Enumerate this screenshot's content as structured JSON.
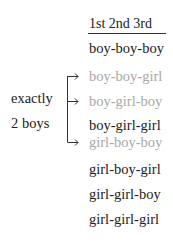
{
  "header": {
    "label": "1st  2nd 3rd"
  },
  "label": {
    "line1": "exactly",
    "line2": "2 boys"
  },
  "outcomes": [
    {
      "text": "boy-boy-boy",
      "highlighted": false
    },
    {
      "text": "boy-boy-girl",
      "highlighted": true
    },
    {
      "text": "boy-girl-boy",
      "highlighted": true
    },
    {
      "text": "boy-girl-girl",
      "highlighted": false
    },
    {
      "text": "girl-boy-boy",
      "highlighted": true
    },
    {
      "text": "girl-boy-girl",
      "highlighted": false
    },
    {
      "text": "girl-girl-boy",
      "highlighted": false
    },
    {
      "text": "girl-girl-girl",
      "highlighted": false
    }
  ],
  "colors": {
    "highlight": "#a8a8a8",
    "text": "#222222"
  }
}
